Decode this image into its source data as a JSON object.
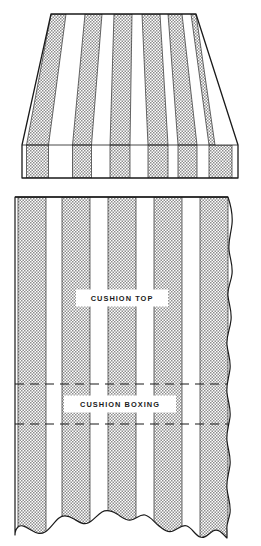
{
  "figure": {
    "background_color": "#ffffff",
    "ink_color": "#1a1a1a",
    "stripe_fill_color": "#c9c9c9",
    "ground_color": "#ffffff",
    "width": 261,
    "height": 546
  },
  "upper_figure": {
    "name": "cushion-perspective-view",
    "shape": "trapezoid-with-boxing-band",
    "top_edge_y": 14,
    "top_left_x": 51,
    "top_right_x": 196,
    "boxing_line_y": 145,
    "bottom_edge_y": 178,
    "bottom_left_x": 22,
    "bottom_right_x": 238,
    "stripe_count": 6,
    "stripes_top": [
      {
        "x1": 51,
        "x2": 66
      },
      {
        "x1": 85,
        "x2": 102
      },
      {
        "x1": 114,
        "x2": 132
      },
      {
        "x1": 142,
        "x2": 160
      },
      {
        "x1": 168,
        "x2": 182
      },
      {
        "x1": 191,
        "x2": 196
      }
    ]
  },
  "lower_figure": {
    "name": "fabric-yardage-panel",
    "top_edge_y": 197,
    "left_edge_x": 15,
    "right_edge_x": 233,
    "bottom_edge_y": 538,
    "torn_right_edge": true,
    "torn_bottom_edge": true,
    "stripe_count": 5,
    "stripes": [
      {
        "x1": 18,
        "x2": 46
      },
      {
        "x1": 62,
        "x2": 90
      },
      {
        "x1": 108,
        "x2": 136
      },
      {
        "x1": 154,
        "x2": 182
      },
      {
        "x1": 200,
        "x2": 228
      }
    ],
    "dashed_lines": [
      {
        "name": "boxing-upper-guide",
        "y": 384
      },
      {
        "name": "boxing-lower-guide",
        "y": 424
      }
    ],
    "labels": [
      {
        "name": "cushion-top",
        "text": "CUSHION TOP",
        "cx": 122,
        "cy": 298,
        "width": 92,
        "height": 17
      },
      {
        "name": "cushion-boxing",
        "text": "CUSHION BOXING",
        "cx": 120,
        "cy": 404,
        "width": 112,
        "height": 17
      }
    ]
  }
}
